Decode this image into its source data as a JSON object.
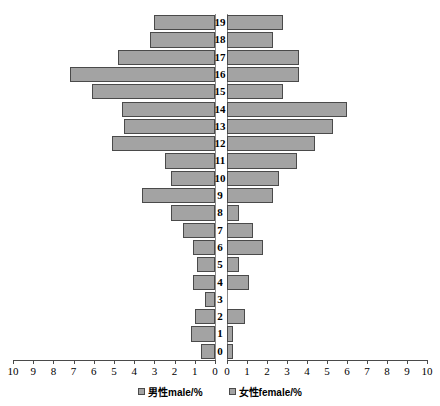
{
  "chart_data": {
    "type": "bar",
    "subtype": "population-pyramid",
    "title": "",
    "xlabel": "",
    "ylabel": "",
    "orientation": "horizontal-diverging",
    "grid": false,
    "legend_position": "bottom",
    "categories": [
      "0",
      "1",
      "2",
      "3",
      "4",
      "5",
      "6",
      "7",
      "8",
      "9",
      "10",
      "11",
      "12",
      "13",
      "14",
      "15",
      "16",
      "17",
      "18",
      "19"
    ],
    "x_tick_labels_left": [
      "10",
      "9",
      "8",
      "7",
      "6",
      "5",
      "4",
      "3",
      "2",
      "1",
      "0"
    ],
    "x_tick_labels_right": [
      "0",
      "1",
      "2",
      "3",
      "4",
      "5",
      "6",
      "7",
      "8",
      "9",
      "10"
    ],
    "xlim_left": [
      10,
      0
    ],
    "xlim_right": [
      0,
      10
    ],
    "series": [
      {
        "name": "男性male/%",
        "side": "left",
        "color": "#a3a3a3",
        "values": [
          0.7,
          1.2,
          1.0,
          0.5,
          1.1,
          0.9,
          1.1,
          1.6,
          2.2,
          3.6,
          2.2,
          2.5,
          5.1,
          4.5,
          4.6,
          6.1,
          7.2,
          4.8,
          3.2,
          3.0
        ]
      },
      {
        "name": "女性female/%",
        "side": "right",
        "color": "#a3a3a3",
        "values": [
          0.3,
          0.3,
          0.9,
          0.0,
          1.1,
          0.6,
          1.8,
          1.3,
          0.6,
          2.3,
          2.6,
          3.5,
          4.4,
          5.3,
          6.0,
          2.8,
          3.6,
          3.6,
          2.3,
          2.8
        ]
      }
    ]
  },
  "legend": {
    "items": [
      {
        "label": "男性male/%"
      },
      {
        "label": "女性female/%"
      }
    ]
  },
  "colors": {
    "bar_fill": "#a3a3a3",
    "bar_stroke": "#4a4a4a",
    "axis": "#4a4a4a",
    "text": "#000000",
    "background": "#ffffff"
  }
}
